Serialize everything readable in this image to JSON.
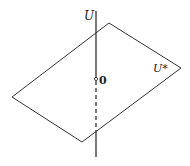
{
  "diagram": {
    "labels": {
      "line": "U",
      "plane": "U*",
      "origin": "0"
    },
    "colors": {
      "stroke": "#333333",
      "background": "#ffffff"
    },
    "plane_vertices": [
      [
        109,
        23
      ],
      [
        181,
        68
      ],
      [
        82,
        142
      ],
      [
        12,
        97
      ]
    ],
    "line": {
      "x": 96,
      "y_top": 11,
      "y_bottom": 157,
      "dashed_from": 82,
      "dashed_to": 130
    },
    "origin_point": [
      96,
      79
    ]
  }
}
